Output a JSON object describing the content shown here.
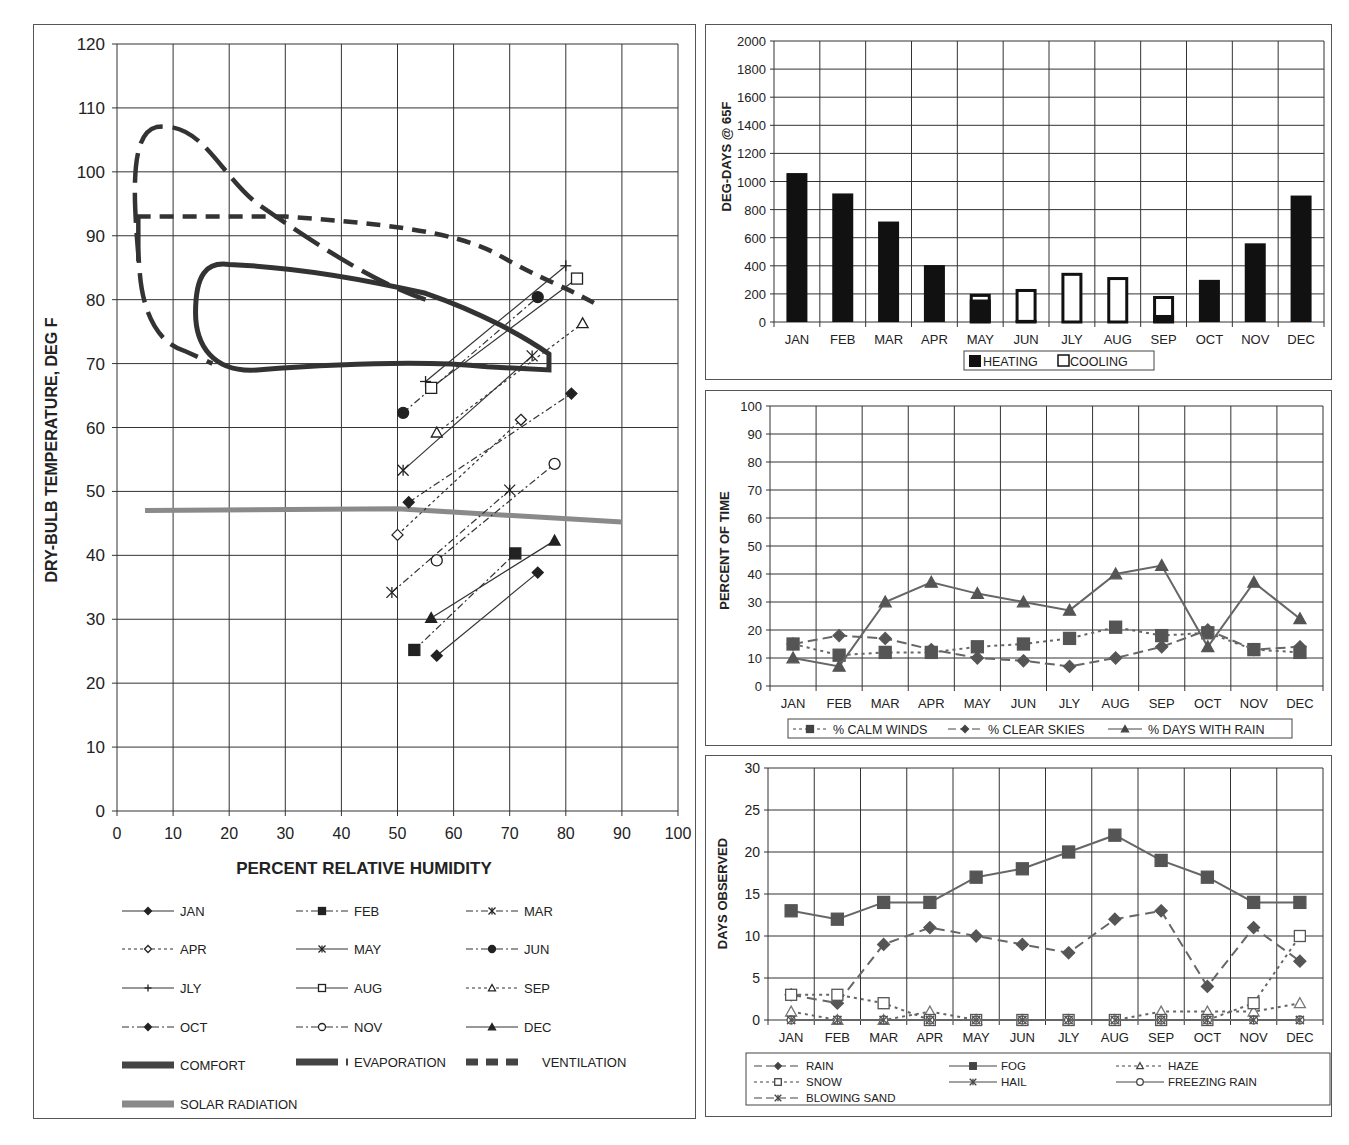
{
  "chart_data": [
    {
      "id": "bioclimatic",
      "type": "line",
      "title": "",
      "xlabel": "PERCENT RELATIVE HUMIDITY",
      "ylabel": "DRY-BULB TEMPERATURE, DEG F",
      "xlim": [
        0,
        100
      ],
      "ylim": [
        0,
        120
      ],
      "xticks": [
        0,
        10,
        20,
        30,
        40,
        50,
        60,
        70,
        80,
        90,
        100
      ],
      "yticks": [
        0,
        10,
        20,
        30,
        40,
        50,
        60,
        70,
        80,
        90,
        100,
        110,
        120
      ],
      "grid": true,
      "legend_position": "bottom",
      "series": [
        {
          "name": "JAN",
          "marker": "diamond-filled",
          "dash": "solid",
          "points": [
            [
              57,
              24.3
            ],
            [
              75,
              37.3
            ]
          ]
        },
        {
          "name": "FEB",
          "marker": "square-filled",
          "dash": "dashdot",
          "points": [
            [
              53,
              25.2
            ],
            [
              71,
              40.3
            ]
          ]
        },
        {
          "name": "MAR",
          "marker": "star",
          "dash": "dashdot",
          "points": [
            [
              49,
              34.2
            ],
            [
              70,
              50.2
            ]
          ]
        },
        {
          "name": "APR",
          "marker": "diamond-open",
          "dash": "dotted",
          "points": [
            [
              50,
              43.2
            ],
            [
              72,
              61.2
            ]
          ]
        },
        {
          "name": "MAY",
          "marker": "star",
          "dash": "solid",
          "points": [
            [
              51,
              53.3
            ],
            [
              74,
              71.2
            ]
          ]
        },
        {
          "name": "JUN",
          "marker": "circle-filled",
          "dash": "dashdot",
          "points": [
            [
              51,
              62.3
            ],
            [
              75,
              80.4
            ]
          ]
        },
        {
          "name": "JLY",
          "marker": "plus",
          "dash": "solid",
          "points": [
            [
              55,
              67.2
            ],
            [
              80,
              85.3
            ]
          ]
        },
        {
          "name": "AUG",
          "marker": "square-open",
          "dash": "solid",
          "points": [
            [
              56,
              66.2
            ],
            [
              82,
              83.3
            ]
          ]
        },
        {
          "name": "SEP",
          "marker": "triangle-open",
          "dash": "dotted",
          "points": [
            [
              57,
              59.2
            ],
            [
              83,
              76.3
            ]
          ]
        },
        {
          "name": "OCT",
          "marker": "diamond-filled",
          "dash": "dashdot",
          "points": [
            [
              52,
              48.3
            ],
            [
              81,
              65.3
            ]
          ]
        },
        {
          "name": "NOV",
          "marker": "circle-open",
          "dash": "dashdot",
          "points": [
            [
              57,
              39.2
            ],
            [
              78,
              54.3
            ]
          ]
        },
        {
          "name": "DEC",
          "marker": "triangle-filled",
          "dash": "solid",
          "points": [
            [
              56,
              30.2
            ],
            [
              78,
              42.3
            ]
          ]
        }
      ],
      "zones": [
        {
          "name": "COMFORT",
          "style": "thick-solid"
        },
        {
          "name": "EVAPORATION",
          "style": "thick-long-dash"
        },
        {
          "name": "VENTILATION",
          "style": "thick-short-dash"
        },
        {
          "name": "SOLAR RADIATION",
          "style": "thick-gray",
          "points": [
            [
              5,
              47
            ],
            [
              50,
              47.3
            ],
            [
              90,
              45.2
            ]
          ]
        }
      ]
    },
    {
      "id": "degree-days",
      "type": "bar",
      "ylabel": "DEG-DAYS @ 65F",
      "ylim": [
        0,
        2000
      ],
      "yticks": [
        0,
        200,
        400,
        600,
        800,
        1000,
        1200,
        1400,
        1600,
        1800,
        2000
      ],
      "categories": [
        "JAN",
        "FEB",
        "MAR",
        "APR",
        "MAY",
        "JUN",
        "JLY",
        "AUG",
        "SEP",
        "OCT",
        "NOV",
        "DEC"
      ],
      "series": [
        {
          "name": "HEATING",
          "values": [
            1060,
            915,
            715,
            405,
            160,
            15,
            0,
            0,
            50,
            300,
            560,
            900
          ]
        },
        {
          "name": "COOLING",
          "values": [
            0,
            0,
            0,
            0,
            40,
            220,
            350,
            320,
            135,
            0,
            0,
            0
          ]
        }
      ],
      "bar_totals": [
        1060,
        915,
        715,
        405,
        200,
        235,
        350,
        320,
        185,
        300,
        560,
        900
      ],
      "grid": true,
      "legend_position": "bottom"
    },
    {
      "id": "percent-of-time",
      "type": "line",
      "ylabel": "PERCENT OF TIME",
      "ylim": [
        0,
        100
      ],
      "yticks": [
        0,
        10,
        20,
        30,
        40,
        50,
        60,
        70,
        80,
        90,
        100
      ],
      "categories": [
        "JAN",
        "FEB",
        "MAR",
        "APR",
        "MAY",
        "JUN",
        "JLY",
        "AUG",
        "SEP",
        "OCT",
        "NOV",
        "DEC"
      ],
      "series": [
        {
          "name": "% CALM WINDS",
          "values": [
            15,
            11,
            12,
            12,
            14,
            15,
            17,
            21,
            18,
            19,
            13,
            12
          ]
        },
        {
          "name": "% CLEAR SKIES",
          "values": [
            15,
            18,
            17,
            13,
            10,
            9,
            7,
            10,
            14,
            20,
            13,
            14
          ]
        },
        {
          "name": "% DAYS WITH RAIN",
          "values": [
            10,
            7,
            30,
            37,
            33,
            30,
            27,
            40,
            43,
            14,
            37,
            24
          ]
        }
      ],
      "grid": true,
      "legend_position": "bottom"
    },
    {
      "id": "days-observed",
      "type": "line",
      "ylabel": "DAYS OBSERVED",
      "ylim": [
        0,
        30
      ],
      "yticks": [
        0,
        5,
        10,
        15,
        20,
        25,
        30
      ],
      "categories": [
        "JAN",
        "FEB",
        "MAR",
        "APR",
        "MAY",
        "JUN",
        "JLY",
        "AUG",
        "SEP",
        "OCT",
        "NOV",
        "DEC"
      ],
      "series": [
        {
          "name": "RAIN",
          "values": [
            3,
            2,
            9,
            11,
            10,
            9,
            8,
            12,
            13,
            4,
            11,
            7
          ]
        },
        {
          "name": "FOG",
          "values": [
            13,
            12,
            14,
            14,
            17,
            18,
            20,
            22,
            19,
            17,
            14,
            14
          ]
        },
        {
          "name": "HAZE",
          "values": [
            1,
            0,
            0,
            1,
            0,
            0,
            0,
            0,
            1,
            1,
            1,
            2
          ]
        },
        {
          "name": "SNOW",
          "values": [
            3,
            3,
            2,
            0,
            0,
            0,
            0,
            0,
            0,
            0,
            2,
            10
          ]
        },
        {
          "name": "HAIL",
          "values": [
            0,
            0,
            0,
            0,
            0,
            0,
            0,
            0,
            0,
            0,
            0,
            0
          ]
        },
        {
          "name": "FREEZING RAIN",
          "values": [
            0,
            0,
            0,
            0,
            0,
            0,
            0,
            0,
            0,
            0,
            0,
            0
          ]
        },
        {
          "name": "BLOWING SAND",
          "values": [
            0,
            0,
            0,
            0,
            0,
            0,
            0,
            0,
            0,
            0,
            0,
            0
          ]
        }
      ],
      "grid": true,
      "legend_position": "bottom"
    }
  ],
  "main": {
    "ylabel": "DRY-BULB TEMPERATURE, DEG F",
    "xlabel": "PERCENT RELATIVE HUMIDITY",
    "legend": [
      "JAN",
      "FEB",
      "MAR",
      "APR",
      "MAY",
      "JUN",
      "JLY",
      "AUG",
      "SEP",
      "OCT",
      "NOV",
      "DEC",
      "COMFORT",
      "EVAPORATION",
      "VENTILATION",
      "SOLAR RADIATION"
    ]
  },
  "bars": {
    "ylabel": "DEG-DAYS @ 65F",
    "legend": {
      "heating": "HEATING",
      "cooling": "COOLING"
    }
  },
  "pct": {
    "ylabel": "PERCENT OF TIME",
    "legend": {
      "calm": "% CALM WINDS",
      "clear": "% CLEAR SKIES",
      "rain": "% DAYS WITH RAIN"
    }
  },
  "days": {
    "ylabel": "DAYS OBSERVED",
    "legend": {
      "rain": "RAIN",
      "fog": "FOG",
      "haze": "HAZE",
      "snow": "SNOW",
      "hail": "HAIL",
      "frz": "FREEZING RAIN",
      "sand": "BLOWING SAND"
    }
  },
  "colors": {
    "ink": "#222222",
    "grid": "#333333",
    "solar": "#8a8a8a",
    "series_gray": "#555555"
  }
}
